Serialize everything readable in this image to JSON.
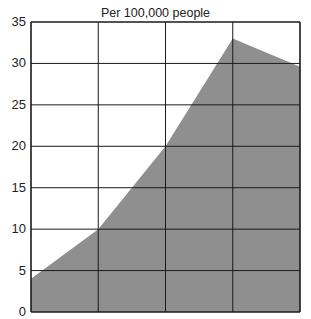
{
  "chart_data": {
    "type": "area",
    "title": "",
    "subtitle": "Per 100,000 people",
    "xlabel": "",
    "ylabel": "",
    "x": [
      0,
      1,
      2,
      3,
      4
    ],
    "categories": [
      "",
      "",
      "",
      "",
      ""
    ],
    "series": [
      {
        "name": "Rate per 100,000 people",
        "values": [
          4.0,
          10.0,
          20.0,
          33.0,
          29.6
        ],
        "color": "#8f8f8f"
      }
    ],
    "ylim": [
      0,
      35
    ],
    "yticks": [
      0,
      5,
      10,
      15,
      20,
      25,
      30,
      35
    ],
    "grid": true,
    "legend": "none"
  },
  "header": {
    "subtitle": "Per 100,000 people"
  },
  "axis": {
    "y_labels": [
      "35",
      "30",
      "25",
      "20",
      "15",
      "10",
      "5",
      "0"
    ]
  },
  "colors": {
    "area": "#8f8f8f",
    "grid": "#1a1a1a",
    "background": "#ffffff"
  }
}
